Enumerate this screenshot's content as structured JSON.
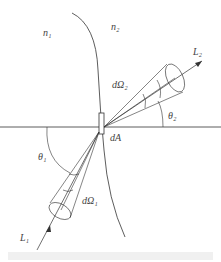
{
  "diagram": {
    "labels": {
      "n1": "n₁",
      "n2": "n₂",
      "L2": "L₂",
      "dOmega2": "dΩ₂",
      "theta2": "θ₂",
      "dA": "dA",
      "theta1": "θ₁",
      "dOmega1": "dΩ₁",
      "L1": "L₁"
    },
    "caption": ""
  }
}
